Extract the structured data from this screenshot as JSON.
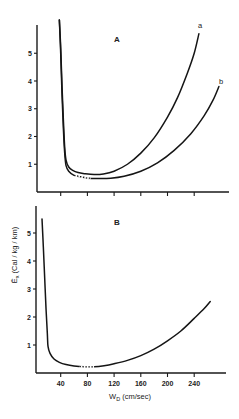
{
  "chart_data": [
    {
      "type": "line",
      "panel_label": "A",
      "xlabel": "",
      "ylabel": "",
      "xlim": [
        0,
        285
      ],
      "ylim": [
        0,
        6.0
      ],
      "x_ticks": [
        40,
        80,
        120,
        160,
        200,
        240
      ],
      "x_tick_labels_shown": false,
      "y_ticks": [
        1,
        2,
        3,
        4,
        5
      ],
      "y_tick_labels": [
        "1",
        "2",
        "3",
        "4",
        "5"
      ],
      "grid": false,
      "series": [
        {
          "name": "a",
          "points": [
            [
              38,
              6.2
            ],
            [
              40,
              5.2
            ],
            [
              42,
              3.8
            ],
            [
              44,
              2.6
            ],
            [
              46,
              1.6
            ],
            [
              48,
              1.15
            ],
            [
              52,
              0.9
            ],
            [
              58,
              0.78
            ],
            [
              66,
              0.7
            ],
            [
              76,
              0.66
            ],
            [
              90,
              0.63
            ],
            [
              104,
              0.65
            ],
            [
              120,
              0.75
            ],
            [
              140,
              1.0
            ],
            [
              160,
              1.4
            ],
            [
              180,
              1.95
            ],
            [
              200,
              2.7
            ],
            [
              215,
              3.4
            ],
            [
              230,
              4.3
            ],
            [
              240,
              5.0
            ],
            [
              247,
              5.7
            ]
          ],
          "dotted_range": []
        },
        {
          "name": "b",
          "points": [
            [
              38,
              6.2
            ],
            [
              40,
              5.0
            ],
            [
              42,
              3.5
            ],
            [
              44,
              2.3
            ],
            [
              46,
              1.4
            ],
            [
              48,
              0.95
            ],
            [
              52,
              0.75
            ],
            [
              60,
              0.6
            ],
            [
              70,
              0.55
            ],
            [
              80,
              0.5
            ],
            [
              95,
              0.49
            ],
            [
              115,
              0.5
            ],
            [
              135,
              0.57
            ],
            [
              160,
              0.75
            ],
            [
              185,
              1.05
            ],
            [
              210,
              1.5
            ],
            [
              235,
              2.1
            ],
            [
              255,
              2.75
            ],
            [
              268,
              3.3
            ],
            [
              277,
              3.8
            ]
          ],
          "dotted_range": [
            60,
            85
          ]
        }
      ]
    },
    {
      "type": "line",
      "panel_label": "B",
      "xlabel": "W_D (cm/sec)",
      "ylabel": "Ē_x (Cal / kg / km)",
      "xlim": [
        0,
        285
      ],
      "ylim": [
        0,
        6.0
      ],
      "x_ticks": [
        40,
        80,
        120,
        160,
        200,
        240
      ],
      "x_tick_labels": [
        "40",
        "80",
        "120",
        "160",
        "200",
        "240"
      ],
      "y_ticks": [
        1,
        2,
        3,
        4,
        5
      ],
      "y_tick_labels": [
        "1",
        "2",
        "3",
        "4",
        "5"
      ],
      "grid": false,
      "series": [
        {
          "name": "B",
          "points": [
            [
              12,
              5.5
            ],
            [
              14,
              4.5
            ],
            [
              16,
              3.4
            ],
            [
              18,
              2.3
            ],
            [
              20,
              1.4
            ],
            [
              21,
              0.95
            ],
            [
              24,
              0.7
            ],
            [
              30,
              0.5
            ],
            [
              38,
              0.38
            ],
            [
              48,
              0.3
            ],
            [
              60,
              0.25
            ],
            [
              75,
              0.22
            ],
            [
              90,
              0.22
            ],
            [
              105,
              0.26
            ],
            [
              120,
              0.33
            ],
            [
              140,
              0.45
            ],
            [
              160,
              0.62
            ],
            [
              180,
              0.85
            ],
            [
              200,
              1.15
            ],
            [
              220,
              1.5
            ],
            [
              240,
              1.95
            ],
            [
              255,
              2.3
            ],
            [
              264,
              2.55
            ]
          ],
          "dotted_range": [
            68,
            90
          ]
        }
      ]
    }
  ],
  "labels": {
    "panel_a": "A",
    "panel_b": "B",
    "curve_a": "a",
    "curve_b": "b",
    "ylabel": "Ē",
    "ylabel_sub": "x",
    "ylabel_units": " (Cal / kg / km)",
    "xlabel": "W",
    "xlabel_sub": "D",
    "xlabel_units": " (cm/sec)"
  }
}
